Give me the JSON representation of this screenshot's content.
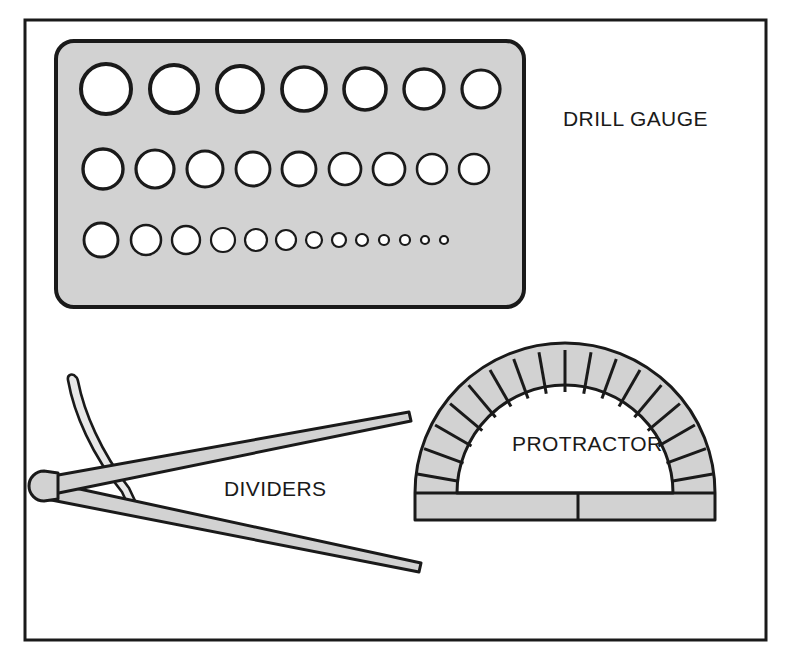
{
  "figure": {
    "background_color": "#ffffff",
    "frame": {
      "name": "outer-frame",
      "x": 25,
      "y": 20,
      "width": 741,
      "height": 620,
      "stroke_color": "#1a1a1a",
      "stroke_width": 3,
      "fill": "none"
    },
    "palette": {
      "ink": "#1a1a1a",
      "metal_gray": "#d2d2d2",
      "metal_gray_light": "#dcdcdc",
      "hole_white": "#ffffff",
      "paper_white": "#ffffff"
    }
  },
  "tools": [
    {
      "id": "drill-gauge",
      "label": "DRILL GAUGE",
      "label_x": 563,
      "label_y": 126,
      "plate": {
        "x": 56,
        "y": 41,
        "width": 468,
        "height": 266,
        "corner_radius": 18,
        "fill": "#d2d2d2",
        "stroke_color": "#1a1a1a",
        "stroke_width": 4
      },
      "hole_rows": [
        {
          "row": 1,
          "count": 7,
          "cy": 89,
          "holes": [
            {
              "cx": 106,
              "r": 25
            },
            {
              "cx": 174,
              "r": 24
            },
            {
              "cx": 240,
              "r": 23
            },
            {
              "cx": 304,
              "r": 22
            },
            {
              "cx": 365,
              "r": 21
            },
            {
              "cx": 424,
              "r": 20
            },
            {
              "cx": 481,
              "r": 19
            }
          ]
        },
        {
          "row": 2,
          "count": 9,
          "cy": 169,
          "holes": [
            {
              "cx": 103,
              "r": 20
            },
            {
              "cx": 155,
              "r": 19
            },
            {
              "cx": 205,
              "r": 18
            },
            {
              "cx": 253,
              "r": 17
            },
            {
              "cx": 299,
              "r": 17
            },
            {
              "cx": 345,
              "r": 16
            },
            {
              "cx": 389,
              "r": 16
            },
            {
              "cx": 432,
              "r": 15
            },
            {
              "cx": 474,
              "r": 15
            }
          ]
        },
        {
          "row": 3,
          "count": 13,
          "cy": 240,
          "holes": [
            {
              "cx": 101,
              "r": 17
            },
            {
              "cx": 146,
              "r": 15
            },
            {
              "cx": 186,
              "r": 14
            },
            {
              "cx": 223,
              "r": 12
            },
            {
              "cx": 256,
              "r": 11
            },
            {
              "cx": 286,
              "r": 10
            },
            {
              "cx": 314,
              "r": 8
            },
            {
              "cx": 339,
              "r": 7
            },
            {
              "cx": 362,
              "r": 6
            },
            {
              "cx": 384,
              "r": 5
            },
            {
              "cx": 405,
              "r": 5
            },
            {
              "cx": 425,
              "r": 4
            },
            {
              "cx": 444,
              "r": 4
            }
          ]
        }
      ]
    },
    {
      "id": "dividers",
      "label": "DIVIDERS",
      "label_x": 224,
      "label_y": 496,
      "pivot": {
        "cx": 41,
        "cy": 487,
        "rx": 10,
        "ry": 10
      },
      "legs": [
        {
          "name": "upper-leg",
          "tip_x": 408,
          "tip_y": 416,
          "base_y": 478
        },
        {
          "name": "lower-leg",
          "tip_x": 420,
          "tip_y": 568,
          "base_y": 496
        }
      ],
      "arc_arm": {
        "name": "quadrant-arc",
        "top_x": 76,
        "top_y": 377,
        "bottom_x": 132,
        "bottom_y": 508
      },
      "fill": "#d2d2d2",
      "stroke_color": "#1a1a1a",
      "stroke_width": 3
    },
    {
      "id": "protractor",
      "label": "PROTRACTOR",
      "label_x": 512,
      "label_y": 451,
      "center_x": 565,
      "center_y": 500,
      "outer_radius": 150,
      "inner_radius": 108,
      "base_top_y": 493,
      "base_bottom_y": 520,
      "tick_count": 17,
      "tick_spacing_degrees": 10,
      "has_center_mark": true,
      "center_mark_x": 578,
      "fill": "#d2d2d2",
      "stroke_color": "#1a1a1a",
      "stroke_width": 3
    }
  ]
}
